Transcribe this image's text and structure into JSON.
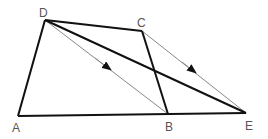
{
  "diagram": {
    "type": "geometry",
    "points": {
      "A": {
        "x": 18,
        "y": 116,
        "label": "A",
        "lx": 17,
        "ly": 132
      },
      "B": {
        "x": 168,
        "y": 114,
        "label": "B",
        "lx": 170,
        "ly": 131
      },
      "C": {
        "x": 142,
        "y": 31,
        "label": "C",
        "lx": 141,
        "ly": 27
      },
      "D": {
        "x": 45,
        "y": 20,
        "label": "D",
        "lx": 44,
        "ly": 17
      },
      "E": {
        "x": 246,
        "y": 113,
        "label": "E",
        "lx": 249,
        "ly": 130
      }
    },
    "thick_segments": [
      [
        "A",
        "D"
      ],
      [
        "D",
        "C"
      ],
      [
        "C",
        "B"
      ],
      [
        "A",
        "E"
      ],
      [
        "D",
        "E"
      ]
    ],
    "thin_arrow_segments": [
      [
        "D",
        "B"
      ],
      [
        "C",
        "E"
      ]
    ],
    "colors": {
      "stroke": "#111111",
      "thin": "#888888",
      "label": "#555555"
    }
  }
}
